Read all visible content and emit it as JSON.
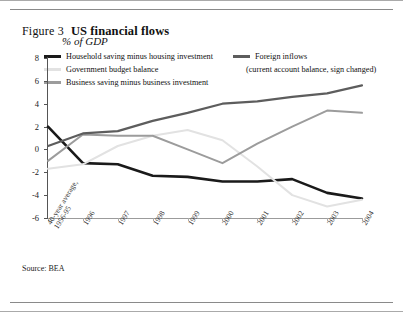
{
  "figure": {
    "number": "Figure 3",
    "title": "US financial flows",
    "subtitle": "% of GDP",
    "source": "Source: BEA"
  },
  "legend": {
    "items": [
      {
        "label": "Household saving minus housing investment",
        "color": "#1a1a1a"
      },
      {
        "label": "Government budget balance",
        "color": "#e2e2e2"
      },
      {
        "label": "Business saving minus business investment",
        "color": "#9c9c9c"
      },
      {
        "label": "Foreign inflows",
        "color": "#5d5d5d"
      }
    ],
    "note": "(current account balance, sign changed)"
  },
  "axes": {
    "y_ticks": [
      "8",
      "6",
      "4",
      "2",
      "0",
      "-2",
      "-4",
      "-6"
    ],
    "x_labels": [
      "40-year average,\n1956-95",
      "1996",
      "1997",
      "1998",
      "1999",
      "2000",
      "2001",
      "2002",
      "2003",
      "2004"
    ]
  },
  "chart_data": {
    "type": "line",
    "title": "US financial flows",
    "subtitle": "% of GDP",
    "xlabel": "",
    "ylabel": "% of GDP",
    "ylim": [
      -6,
      8
    ],
    "ytick_step": 2,
    "grid": false,
    "legend_position": "top",
    "categories": [
      "40-year average, 1956-95",
      "1996",
      "1997",
      "1998",
      "1999",
      "2000",
      "2001",
      "2002",
      "2003",
      "2004"
    ],
    "series": [
      {
        "name": "Household saving minus housing investment",
        "color": "#1a1a1a",
        "values": [
          2.0,
          -1.2,
          -1.3,
          -2.3,
          -2.4,
          -2.8,
          -2.8,
          -2.6,
          -3.8,
          -4.3
        ]
      },
      {
        "name": "Government budget balance",
        "color": "#e2e2e2",
        "values": [
          -1.7,
          -1.3,
          0.3,
          1.2,
          1.7,
          0.8,
          -1.5,
          -4.0,
          -5.0,
          -4.4
        ]
      },
      {
        "name": "Business saving minus business investment",
        "color": "#9c9c9c",
        "values": [
          -1.0,
          1.3,
          1.2,
          1.2,
          0.0,
          -1.2,
          0.5,
          2.0,
          3.4,
          3.2
        ]
      },
      {
        "name": "Foreign inflows (current account balance, sign changed)",
        "color": "#5d5d5d",
        "values": [
          0.3,
          1.4,
          1.6,
          2.5,
          3.2,
          4.0,
          4.2,
          4.6,
          4.9,
          5.6
        ]
      }
    ]
  }
}
